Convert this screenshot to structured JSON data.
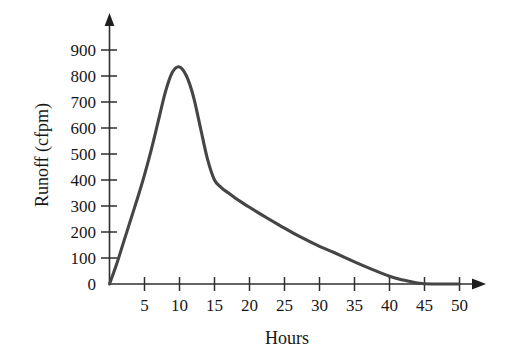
{
  "chart_data": {
    "type": "line",
    "title": "",
    "xlabel": "Hours",
    "ylabel": "Runoff (cfpm)",
    "xlim": [
      0,
      52
    ],
    "ylim": [
      0,
      950
    ],
    "grid": false,
    "legend": null,
    "x_ticks": [
      5,
      10,
      15,
      20,
      25,
      30,
      35,
      40,
      45,
      50
    ],
    "x_tick_labels": [
      "5",
      "10",
      "15",
      "20",
      "25",
      "30",
      "35",
      "40",
      "45",
      "50"
    ],
    "y_ticks": [
      0,
      100,
      200,
      300,
      400,
      500,
      600,
      700,
      800,
      900
    ],
    "y_tick_labels": [
      "0",
      "100",
      "200",
      "300",
      "400",
      "500",
      "600",
      "700",
      "800",
      "900"
    ],
    "series": [
      {
        "name": "Runoff",
        "color": "#454545",
        "x": [
          0,
          1,
          2,
          3,
          4,
          5,
          6,
          7,
          8,
          9,
          10,
          11,
          12,
          13,
          14,
          15,
          16,
          17,
          18,
          19,
          20,
          22,
          24,
          25,
          27,
          30,
          32,
          35,
          37,
          40,
          42,
          44,
          46,
          50
        ],
        "y": [
          0,
          75,
          160,
          245,
          330,
          420,
          520,
          630,
          740,
          815,
          835,
          800,
          720,
          600,
          480,
          400,
          370,
          350,
          330,
          312,
          295,
          262,
          230,
          215,
          185,
          145,
          122,
          85,
          62,
          30,
          15,
          4,
          0,
          0
        ]
      }
    ],
    "annotations": {
      "peak_value": 835,
      "peak_hour": 10,
      "knee_value": 400,
      "knee_hour": 15,
      "baseflow_return_hour": 45
    },
    "axes_style": {
      "x_axis_arrow": "right-arrow-icon",
      "y_axis_arrow": "up-arrow-icon",
      "axis_color": "#2e2e2e",
      "background": "#ffffff"
    }
  }
}
